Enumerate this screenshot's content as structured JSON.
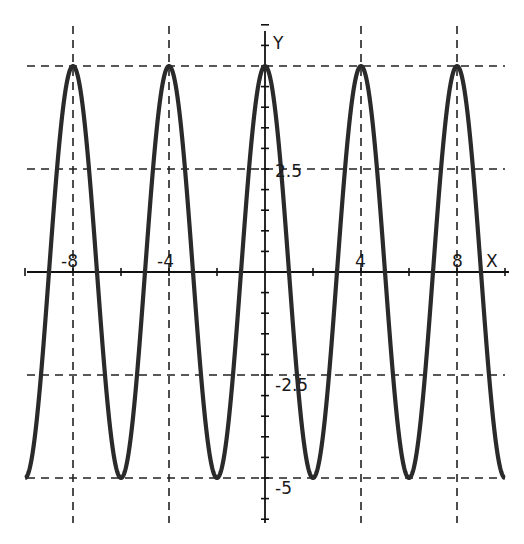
{
  "chart_data": {
    "type": "line",
    "title": "",
    "xlabel": "X",
    "ylabel": "Y",
    "xlim": [
      -10,
      10
    ],
    "ylim": [
      -6,
      6
    ],
    "grid": "dashed at labeled ticks",
    "legend": null,
    "function": "y = 5*cos(pi*x/2)",
    "x_tick_labels": [
      "-8",
      "-4",
      "4",
      "8"
    ],
    "x_tick_values": [
      -8,
      -4,
      4,
      8
    ],
    "y_tick_labels": [
      "2.5",
      "-2.5",
      "-5"
    ],
    "y_tick_values": [
      2.5,
      -2.5,
      -5
    ],
    "grid_y_values": [
      5,
      2.5,
      -2.5,
      -5
    ],
    "grid_x_values": [
      -8,
      -4,
      4,
      8
    ],
    "series": [
      {
        "name": "y = 5cos(πx/2)",
        "x": [
          -10,
          -9,
          -8,
          -7,
          -6,
          -5,
          -4,
          -3,
          -2,
          -1,
          0,
          1,
          2,
          3,
          4,
          5,
          6,
          7,
          8,
          9,
          10
        ],
        "values": [
          -5,
          0,
          5,
          0,
          -5,
          0,
          5,
          0,
          -5,
          0,
          5,
          0,
          -5,
          0,
          5,
          0,
          -5,
          0,
          5,
          0,
          -5
        ]
      }
    ],
    "amplitude": 5,
    "period": 4,
    "peaks_x": [
      -8,
      -4,
      0,
      4,
      8
    ],
    "troughs_x": [
      -10,
      -6,
      -2,
      2,
      6,
      10
    ]
  },
  "axes": {
    "x_label": "X",
    "y_label": "Y"
  },
  "labels": {
    "x_neg8": "-8",
    "x_neg4": "-4",
    "x_4": "4",
    "x_8": "8",
    "y_2_5": "2.5",
    "y_neg2_5": "-2.5",
    "y_neg5": "-5"
  },
  "colors": {
    "curve": "#2a2a2a",
    "axis": "#111111",
    "grid": "#222222",
    "background": "#ffffff"
  }
}
